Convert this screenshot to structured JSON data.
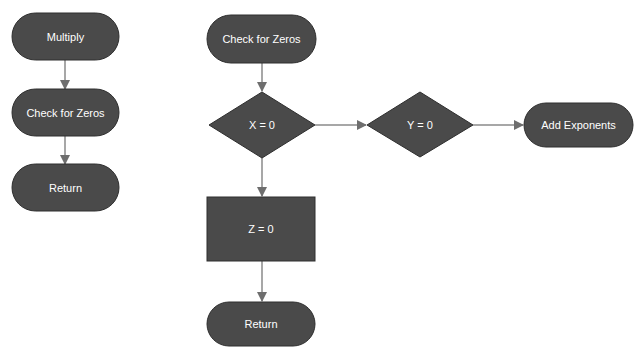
{
  "diagram": {
    "type": "flowchart",
    "colors": {
      "node_fill": "#4a4a4a",
      "node_text": "#ffffff",
      "edge": "#8a8a8a",
      "background": "#ffffff"
    },
    "left_flow": {
      "nodes": [
        {
          "id": "multiply",
          "shape": "terminator",
          "label": "Multiply"
        },
        {
          "id": "check_left",
          "shape": "terminator",
          "label": "Check for Zeros"
        },
        {
          "id": "return_left",
          "shape": "terminator",
          "label": "Return"
        }
      ],
      "edges": [
        {
          "from": "multiply",
          "to": "check_left"
        },
        {
          "from": "check_left",
          "to": "return_left"
        }
      ]
    },
    "right_flow": {
      "nodes": [
        {
          "id": "check_right",
          "shape": "terminator",
          "label": "Check for Zeros"
        },
        {
          "id": "x_zero",
          "shape": "decision",
          "label": "X = 0"
        },
        {
          "id": "y_zero",
          "shape": "decision",
          "label": "Y = 0"
        },
        {
          "id": "add_exp",
          "shape": "terminator",
          "label": "Add Exponents"
        },
        {
          "id": "z_zero",
          "shape": "process",
          "label": "Z = 0"
        },
        {
          "id": "return_right",
          "shape": "terminator",
          "label": "Return"
        }
      ],
      "edges": [
        {
          "from": "check_right",
          "to": "x_zero"
        },
        {
          "from": "x_zero",
          "to": "y_zero"
        },
        {
          "from": "y_zero",
          "to": "add_exp"
        },
        {
          "from": "x_zero",
          "to": "z_zero"
        },
        {
          "from": "z_zero",
          "to": "return_right"
        }
      ]
    }
  }
}
